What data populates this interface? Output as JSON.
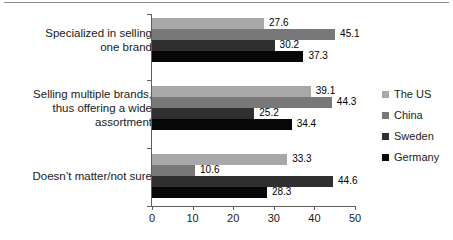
{
  "chart_data": {
    "type": "bar",
    "orientation": "horizontal",
    "title": "",
    "subtitle": "",
    "xlabel": "",
    "ylabel": "",
    "xlim": [
      0,
      50
    ],
    "xticks": [
      "0",
      "10",
      "20",
      "30",
      "40",
      "50"
    ],
    "grid": false,
    "legend_position": "right",
    "categories": [
      "Specialized in selling one brand",
      "Selling multiple brands, thus offering a wide assortment",
      "Doesn’t matter/not sure"
    ],
    "category_lines": [
      [
        "Specialized in selling",
        "one brand"
      ],
      [
        "Selling multiple brands,",
        "thus offering a wide",
        "assortment"
      ],
      [
        "Doesn’t matter/not sure"
      ]
    ],
    "series": [
      {
        "name": "The US",
        "color": "#a8a8a8",
        "values": [
          27.6,
          39.1,
          33.3
        ]
      },
      {
        "name": "China",
        "color": "#787878",
        "values": [
          45.1,
          44.3,
          10.6
        ]
      },
      {
        "name": "Sweden",
        "color": "#2f2f2f",
        "values": [
          30.2,
          25.2,
          44.6
        ]
      },
      {
        "name": "Germany",
        "color": "#070707",
        "values": [
          37.3,
          34.4,
          28.3
        ]
      }
    ],
    "value_labels": [
      [
        "27.6",
        "45.1",
        "30.2",
        "37.3"
      ],
      [
        "39.1",
        "44.3",
        "25.2",
        "34.4"
      ],
      [
        "33.3",
        "10.6",
        "44.6",
        "28.3"
      ]
    ]
  },
  "legend": {
    "items": [
      {
        "label": "The US"
      },
      {
        "label": "China"
      },
      {
        "label": "Sweden"
      },
      {
        "label": "Germany"
      }
    ]
  },
  "axis": {
    "x_tick_labels": [
      "0",
      "10",
      "20",
      "30",
      "40",
      "50"
    ]
  }
}
